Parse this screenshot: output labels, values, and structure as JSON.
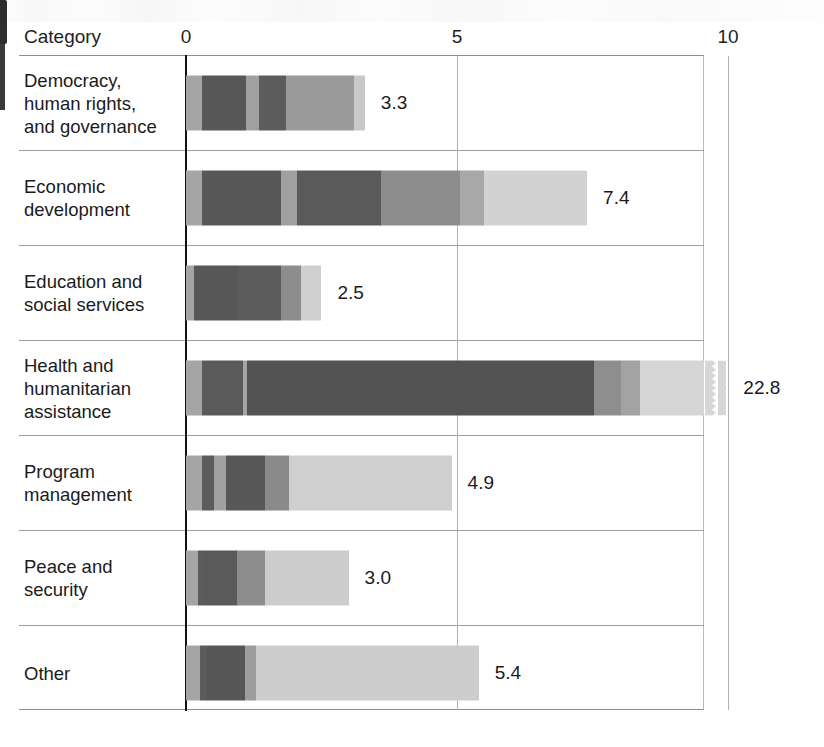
{
  "header": {
    "category_label": "Category"
  },
  "chart_data": {
    "type": "bar",
    "orientation": "horizontal",
    "stacked": true,
    "title": "",
    "xlabel": "",
    "ylabel": "Category",
    "xlim": [
      0,
      10
    ],
    "grid": true,
    "legend": "none",
    "axis_break": true,
    "axis_break_note": "Health and humanitarian assistance bar is truncated with a zig-zag break; true value 22.8",
    "ticks": [
      {
        "label": "0",
        "value": 0
      },
      {
        "label": "5",
        "value": 5
      },
      {
        "label": "10",
        "value": 10
      }
    ],
    "categories": [
      "Democracy, human rights, and governance",
      "Economic development",
      "Education and social services",
      "Health and humanitarian assistance",
      "Program management",
      "Peace and security",
      "Other"
    ],
    "values": [
      3.3,
      7.4,
      2.5,
      22.8,
      4.9,
      3.0,
      5.4
    ],
    "value_labels": [
      "3.3",
      "7.4",
      "2.5",
      "22.8",
      "4.9",
      "3.0",
      "5.4"
    ],
    "rows": [
      {
        "label_lines": [
          "Democracy,",
          "human rights,",
          "and governance"
        ],
        "value": 3.3,
        "value_label": "3.3",
        "truncated": false,
        "segments": [
          {
            "size": 0.3,
            "color": "#a5a5a5"
          },
          {
            "size": 0.8,
            "color": "#585858"
          },
          {
            "size": 0.25,
            "color": "#a0a0a0"
          },
          {
            "size": 0.5,
            "color": "#5c5c5c"
          },
          {
            "size": 1.25,
            "color": "#9a9a9a"
          },
          {
            "size": 0.2,
            "color": "#c9c9c9"
          }
        ]
      },
      {
        "label_lines": [
          "Economic",
          "development"
        ],
        "value": 7.4,
        "value_label": "7.4",
        "truncated": false,
        "segments": [
          {
            "size": 0.3,
            "color": "#a5a5a5"
          },
          {
            "size": 1.45,
            "color": "#585858"
          },
          {
            "size": 0.3,
            "color": "#a0a0a0"
          },
          {
            "size": 1.55,
            "color": "#5a5a5a"
          },
          {
            "size": 1.45,
            "color": "#8d8d8d"
          },
          {
            "size": 0.45,
            "color": "#a8a8a8"
          },
          {
            "size": 1.9,
            "color": "#d2d2d2"
          }
        ]
      },
      {
        "label_lines": [
          "Education and",
          "social services"
        ],
        "value": 2.5,
        "value_label": "2.5",
        "truncated": false,
        "segments": [
          {
            "size": 0.15,
            "color": "#a5a5a5"
          },
          {
            "size": 0.8,
            "color": "#585858"
          },
          {
            "size": 0.8,
            "color": "#5c5c5c"
          },
          {
            "size": 0.38,
            "color": "#8d8d8d"
          },
          {
            "size": 0.37,
            "color": "#cfcfcf"
          }
        ]
      },
      {
        "label_lines": [
          "Health and",
          "humanitarian",
          "assistance"
        ],
        "value": 22.8,
        "value_label": "22.8",
        "truncated": true,
        "segments": [
          {
            "size": 0.3,
            "color": "#a5a5a5"
          },
          {
            "size": 0.75,
            "color": "#5a5a5a"
          },
          {
            "size": 0.08,
            "color": "#a5a5a5"
          },
          {
            "size": 6.4,
            "color": "#535353"
          },
          {
            "size": 0.5,
            "color": "#8e8e8e"
          },
          {
            "size": 0.35,
            "color": "#a3a3a3"
          },
          {
            "size": 1.35,
            "color": "#d6d6d6"
          }
        ]
      },
      {
        "label_lines": [
          "Program",
          "management"
        ],
        "value": 4.9,
        "value_label": "4.9",
        "truncated": false,
        "segments": [
          {
            "size": 0.3,
            "color": "#a5a5a5"
          },
          {
            "size": 0.22,
            "color": "#5c5c5c"
          },
          {
            "size": 0.22,
            "color": "#a0a0a0"
          },
          {
            "size": 0.72,
            "color": "#585858"
          },
          {
            "size": 0.44,
            "color": "#8a8a8a"
          },
          {
            "size": 3.0,
            "color": "#cfcfcf"
          }
        ]
      },
      {
        "label_lines": [
          "Peace and",
          "security"
        ],
        "value": 3.0,
        "value_label": "3.0",
        "truncated": false,
        "segments": [
          {
            "size": 0.22,
            "color": "#a5a5a5"
          },
          {
            "size": 0.1,
            "color": "#5c5c5c"
          },
          {
            "size": 0.62,
            "color": "#5a5a5a"
          },
          {
            "size": 0.52,
            "color": "#8d8d8d"
          },
          {
            "size": 1.54,
            "color": "#cccccc"
          }
        ]
      },
      {
        "label_lines": [
          "Other"
        ],
        "value": 5.4,
        "value_label": "5.4",
        "truncated": false,
        "segments": [
          {
            "size": 0.26,
            "color": "#a5a5a5"
          },
          {
            "size": 0.12,
            "color": "#5c5c5c"
          },
          {
            "size": 0.7,
            "color": "#565656"
          },
          {
            "size": 0.22,
            "color": "#9d9d9d"
          },
          {
            "size": 4.1,
            "color": "#cdcdcd"
          }
        ]
      }
    ]
  }
}
